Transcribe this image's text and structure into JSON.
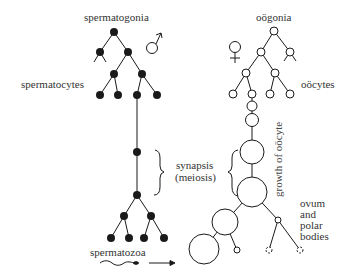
{
  "diagram": {
    "labels": {
      "spermatogonia": "spermatogonia",
      "spermatocytes": "spermatocytes",
      "spermatozoa": "spermatozoa",
      "oogonia": "oögonia",
      "oocytes": "oöcytes",
      "growth": "growth of oöcyte",
      "synapsis": "synapsis",
      "meiosis": "(meiosis)",
      "ovum_line1": "ovum",
      "ovum_line2": "and",
      "ovum_line3": "polar",
      "ovum_line4": "bodies"
    },
    "symbols": {
      "male": "male-symbol",
      "female": "female-symbol"
    },
    "colors": {
      "ink": "#1a1a1a",
      "background": "#ffffff"
    }
  }
}
